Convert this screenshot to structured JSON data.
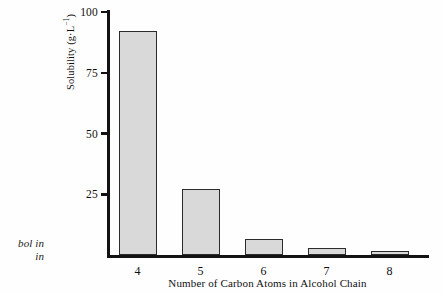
{
  "margin_caption": {
    "lines": [
      "bol in",
      "in"
    ]
  },
  "chart_data": {
    "type": "bar",
    "title": "",
    "subtitle": "",
    "categories": [
      "4",
      "5",
      "6",
      "7",
      "8"
    ],
    "values": [
      92,
      27,
      6.5,
      3,
      1.5
    ],
    "series": [
      {
        "name": "Solubility",
        "values": [
          92,
          27,
          6.5,
          3,
          1.5
        ]
      }
    ],
    "xlabel": "Number of Carbon Atoms in Alcohol Chain",
    "ylabel_text": "Solubility (g·L",
    "ylabel_sup": "−1",
    "ylabel_tail": ")",
    "ylabel_full": "Solubility (g·L⁻¹)",
    "ylim": [
      0,
      100
    ],
    "yticks": [
      100,
      75,
      50,
      25
    ],
    "ytick_labels": [
      "100",
      "75",
      "50",
      "25"
    ],
    "grid": false,
    "legend": false,
    "legend_position": "none",
    "bar_fill_color": "#d9d9d9",
    "bar_border_color": "#2b2b2b",
    "axis_color": "#121212",
    "background_color": "#ffffff"
  }
}
